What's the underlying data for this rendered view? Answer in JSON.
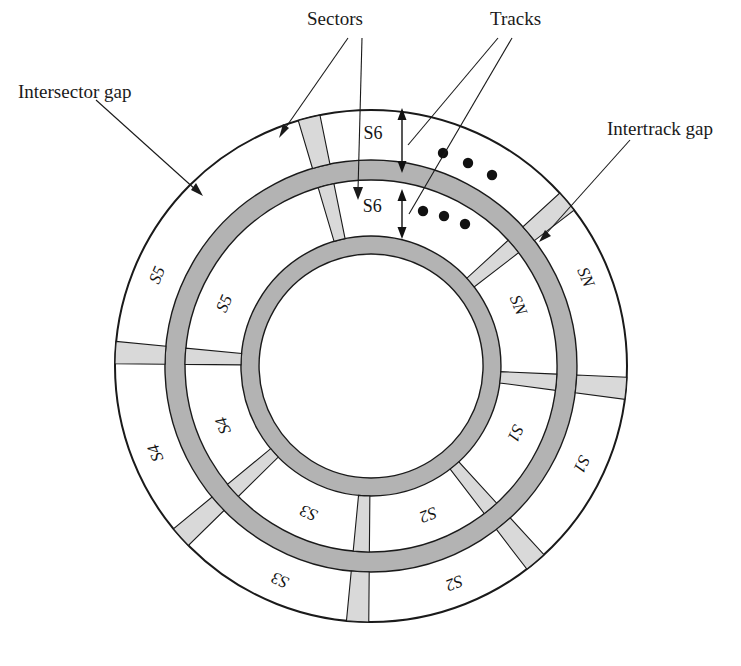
{
  "figure": {
    "type": "disk-layout-diagram"
  },
  "colors": {
    "background": "#ffffff",
    "outline": "#1a1a1a",
    "intertrack_gap_fill": "#b3b3b3",
    "intersector_gap_fill": "#d9d9d9",
    "track_fill": "#ffffff",
    "text": "#141414"
  },
  "callouts": {
    "sectors": "Sectors",
    "tracks": "Tracks",
    "intersector_gap": "Intersector gap",
    "intertrack_gap": "Intertrack gap"
  },
  "geometry": {
    "center_x": 371,
    "center_y": 366,
    "outer_radius": 256,
    "outer_track_inner_radius": 206,
    "intertrack_ring_outer_radius": 206,
    "intertrack_ring_inner_radius": 186,
    "inner_track_outer_radius": 186,
    "inner_track_inner_radius": 130,
    "hub_ring_outer_radius": 130,
    "hub_ring_inner_radius": 112,
    "sector_gap_degrees": 5,
    "sector_count": 6
  },
  "rings": [
    {
      "name": "outer-track",
      "label": "outer track",
      "sectors": [
        "S6",
        "SN",
        "S1",
        "S2",
        "S3",
        "S4",
        "S5"
      ]
    },
    {
      "name": "inner-track",
      "label": "inner track",
      "sectors": [
        "S6",
        "SN",
        "S1",
        "S2",
        "S3",
        "S4",
        "S5"
      ]
    }
  ],
  "outer_track_sectors": [
    {
      "label": "S6",
      "start": -104,
      "end": -75
    },
    {
      "label": "SN",
      "start": -40,
      "end": -5
    },
    {
      "label": "S1",
      "start": 5,
      "end": 45
    },
    {
      "label": "S2",
      "start": 50,
      "end": 88
    },
    {
      "label": "S3",
      "start": 93,
      "end": 133
    },
    {
      "label": "S4",
      "start": 138,
      "end": 178
    },
    {
      "label": "S5",
      "start": 183,
      "end": 223
    }
  ],
  "inner_track_sectors": [
    {
      "label": "S6",
      "start": -104,
      "end": -75
    },
    {
      "label": "SN",
      "start": -40,
      "end": -5
    },
    {
      "label": "S1",
      "start": 5,
      "end": 45
    },
    {
      "label": "S2",
      "start": 50,
      "end": 88
    },
    {
      "label": "S3",
      "start": 93,
      "end": 133
    },
    {
      "label": "S4",
      "start": 138,
      "end": 178
    },
    {
      "label": "S5",
      "start": 183,
      "end": 223
    }
  ],
  "ellipsis": {
    "outer": {
      "count": 3,
      "note": "continuation dots between S6 and SN on outer track"
    },
    "inner": {
      "count": 3,
      "note": "continuation dots between S6 and SN on inner track"
    }
  },
  "dimension_arrows": [
    {
      "name": "outer-track-width",
      "note": "double-headed arrow spanning the outer track band"
    },
    {
      "name": "inner-track-width",
      "note": "double-headed arrow spanning the inner track band"
    }
  ]
}
